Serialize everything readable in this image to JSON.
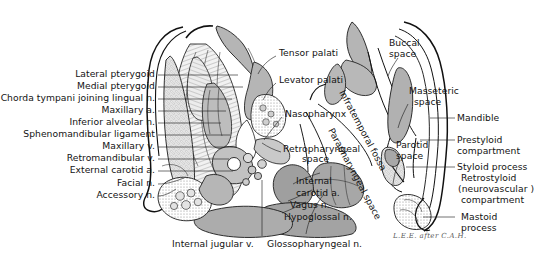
{
  "figure": {
    "type": "anatomical-cross-section",
    "signature": "L.E.E. after C.A.H."
  },
  "labels_left": [
    {
      "id": "lateral-pterygoid",
      "text": "Lateral pterygoid",
      "x": 155,
      "y": 73,
      "leader_to_x": 238,
      "leader_to_y": 78
    },
    {
      "id": "medial-pterygoid",
      "text": "Medial pterygoid",
      "x": 155,
      "y": 85,
      "leader_to_x": 243,
      "leader_to_y": 90
    },
    {
      "id": "chorda-tympani",
      "text": "Chorda tympani joining lingual n.",
      "x": 155,
      "y": 97,
      "leader_to_x": 232,
      "leader_to_y": 102
    },
    {
      "id": "maxillary-artery",
      "text": "Maxillary a.",
      "x": 155,
      "y": 109,
      "leader_to_x": 226,
      "leader_to_y": 114
    },
    {
      "id": "inferior-alveolar-nerve",
      "text": "Inferior alveolar n.",
      "x": 155,
      "y": 121,
      "leader_to_x": 221,
      "leader_to_y": 126
    },
    {
      "id": "sphenomandibular-ligament",
      "text": "Sphenomandibular ligament",
      "x": 155,
      "y": 133,
      "leader_to_x": 230,
      "leader_to_y": 138
    },
    {
      "id": "maxillary-vein",
      "text": "Maxillary v.",
      "x": 155,
      "y": 145,
      "leader_to_x": 236,
      "leader_to_y": 150
    },
    {
      "id": "retromandibular-vein",
      "text": "Retromandibular v.",
      "x": 155,
      "y": 157,
      "leader_to_x": 229,
      "leader_to_y": 162
    },
    {
      "id": "external-carotid-artery",
      "text": "External carotid a.",
      "x": 155,
      "y": 169,
      "leader_to_x": 233,
      "leader_to_y": 173
    },
    {
      "id": "facial-nerve",
      "text": "Facial n.",
      "x": 155,
      "y": 182,
      "leader_to_x": 215,
      "leader_to_y": 186
    },
    {
      "id": "accessory-nerve",
      "text": "Accessory n.",
      "x": 155,
      "y": 194,
      "leader_to_x": 212,
      "leader_to_y": 196
    }
  ],
  "labels_center": [
    {
      "id": "tensor-palati",
      "text": "Tensor palati",
      "x": 279,
      "y": 52
    },
    {
      "id": "levator-palati",
      "text": "Levator palati",
      "x": 279,
      "y": 79
    },
    {
      "id": "nasopharynx",
      "text": "Nasopharynx",
      "x": 285,
      "y": 113
    },
    {
      "id": "retropharyngeal-line1",
      "text": "Retropharyngeal",
      "x": 283,
      "y": 148
    },
    {
      "id": "retropharyngeal-line2",
      "text": "space",
      "x": 302,
      "y": 158
    },
    {
      "id": "internal-carotid-l1",
      "text": "Internal",
      "x": 296,
      "y": 180
    },
    {
      "id": "internal-carotid-l2",
      "text": "carotid a.",
      "x": 296,
      "y": 192
    },
    {
      "id": "vagus-nerve",
      "text": "Vagus n.",
      "x": 290,
      "y": 204
    },
    {
      "id": "hypoglossal-nerve",
      "text": "Hypoglossal n.",
      "x": 284,
      "y": 216
    }
  ],
  "labels_right": [
    {
      "id": "buccal-space-l1",
      "text": "Buccal",
      "x": 389,
      "y": 42
    },
    {
      "id": "buccal-space-l2",
      "text": "space",
      "x": 389,
      "y": 53
    },
    {
      "id": "masseteric-space-l1",
      "text": "Masseteric",
      "x": 409,
      "y": 90
    },
    {
      "id": "masseteric-space-l2",
      "text": "space",
      "x": 414,
      "y": 101
    },
    {
      "id": "parotid-space-l1",
      "text": "Parotid",
      "x": 396,
      "y": 144
    },
    {
      "id": "parotid-space-l2",
      "text": "space",
      "x": 396,
      "y": 155
    }
  ],
  "labels_far_right": [
    {
      "id": "mandible",
      "text": "Mandible",
      "x": 457,
      "y": 117,
      "leader_from_x": 447,
      "leader_from_y": 118
    },
    {
      "id": "prestyloid-1",
      "text": "Prestyloid",
      "x": 457,
      "y": 139,
      "leader_from_x": 447,
      "leader_from_y": 140
    },
    {
      "id": "prestyloid-2",
      "text": "compartment",
      "x": 457,
      "y": 150
    },
    {
      "id": "styloid",
      "text": "Styloid process",
      "x": 457,
      "y": 166,
      "leader_from_x": 449,
      "leader_from_y": 167
    },
    {
      "id": "retrostyloid-1",
      "text": "Retrostyloid",
      "x": 461,
      "y": 177
    },
    {
      "id": "retrostyloid-2",
      "text": "(neurovascular )",
      "x": 458,
      "y": 188
    },
    {
      "id": "retrostyloid-3",
      "text": "compartment",
      "x": 461,
      "y": 199
    },
    {
      "id": "mastoid-1",
      "text": "Mastoid",
      "x": 461,
      "y": 216,
      "leader_from_x": 449,
      "leader_from_y": 217
    },
    {
      "id": "mastoid-2",
      "text": "process",
      "x": 461,
      "y": 227
    }
  ],
  "labels_bottom": [
    {
      "id": "internal-jugular-vein",
      "text": "Internal jugular v.",
      "x": 172,
      "y": 243,
      "leader_from_x": 262,
      "leader_from_y": 238
    },
    {
      "id": "glossopharyngeal-nerve",
      "text": "Glossopharyngeal n.",
      "x": 267,
      "y": 243,
      "leader_from_x": 306,
      "leader_from_y": 236
    }
  ],
  "labels_rotated": [
    {
      "id": "infratemporal-fossa",
      "text": "Infratemporal fossa",
      "x": 345,
      "y": 95,
      "angle": 62
    },
    {
      "id": "parapharyngeal-space",
      "text": "Parapharyngeal space",
      "x": 339,
      "y": 133,
      "angle": 62
    }
  ],
  "colors": {
    "ink": "#131313",
    "outline": "#111111",
    "muscle_fill": "#b9b9b9",
    "vessel_fill": "#a7a7a7",
    "bone_fill": "#d8d8d8",
    "background": "#ffffff"
  }
}
